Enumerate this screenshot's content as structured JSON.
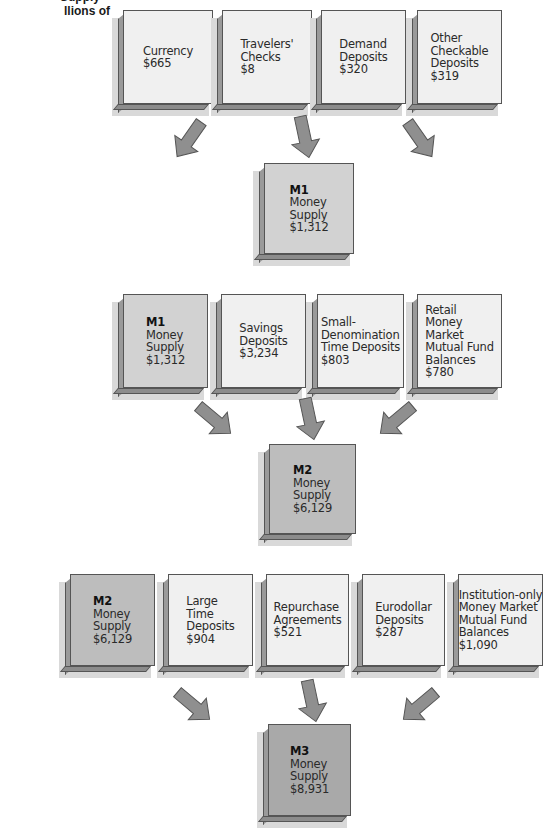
{
  "title_fragment": {
    "line1": "Supply",
    "line2": "llions of"
  },
  "colors": {
    "component_box": "#f0f0f0",
    "m1_box": "#d2d2d2",
    "m2_box": "#bdbdbd",
    "m3_box": "#a9a9a9",
    "arrow": "#8f8f8f",
    "border": "#555555"
  },
  "section_m1": {
    "components": [
      {
        "lines": [
          "Currency",
          "$665"
        ]
      },
      {
        "lines": [
          "Travelers'",
          "Checks",
          "$8"
        ]
      },
      {
        "lines": [
          "Demand",
          "Deposits",
          "$320"
        ]
      },
      {
        "lines": [
          "Other",
          "Checkable",
          "Deposits",
          "$319"
        ]
      }
    ],
    "total": {
      "head": "M1",
      "lines": [
        "Money",
        "Supply",
        "$1,312"
      ]
    }
  },
  "section_m2": {
    "components": [
      {
        "head": "M1",
        "lines": [
          "Money",
          "Supply",
          "$1,312"
        ]
      },
      {
        "lines": [
          "Savings",
          "Deposits",
          "$3,234"
        ]
      },
      {
        "lines": [
          "Small-",
          "Denomination",
          "Time Deposits",
          "$803"
        ]
      },
      {
        "lines": [
          "Retail",
          "Money",
          "Market",
          "Mutual Fund",
          "Balances",
          "$780"
        ]
      }
    ],
    "total": {
      "head": "M2",
      "lines": [
        "Money",
        "Supply",
        "$6,129"
      ]
    }
  },
  "section_m3": {
    "components": [
      {
        "head": "M2",
        "lines": [
          "Money",
          "Supply",
          "$6,129"
        ]
      },
      {
        "lines": [
          "Large",
          "Time",
          "Deposits",
          "$904"
        ]
      },
      {
        "lines": [
          "Repurchase",
          "Agreements",
          "$521"
        ]
      },
      {
        "lines": [
          "Eurodollar",
          "Deposits",
          "$287"
        ]
      },
      {
        "lines": [
          "Institution-only",
          "Money Market",
          "Mutual Fund",
          "Balances",
          "$1,090"
        ]
      }
    ],
    "total": {
      "head": "M3",
      "lines": [
        "Money",
        "Supply",
        "$8,931"
      ]
    }
  }
}
